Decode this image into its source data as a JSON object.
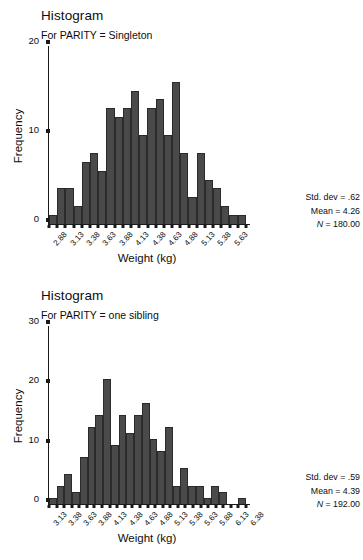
{
  "page": {
    "width": 363,
    "height": 560,
    "background": "#ffffff"
  },
  "style": {
    "bar_fill": "#4a4a4a",
    "bar_stroke": "#2b2b2b",
    "axis_color": "#1a1a1a",
    "text_color": "#0d0d0d"
  },
  "panels": [
    {
      "title": "Histogram",
      "subtitle": "For PARITY = Singleton",
      "xlabel": "Weight (kg)",
      "ylabel": "Frequency",
      "yticks": [
        0,
        10,
        20
      ],
      "stats": {
        "sd_label": "Std. dev = .62",
        "mean_label": "Mean = 4.26",
        "n_symbol": "N",
        "n_label": " = 180.00"
      }
    },
    {
      "title": "Histogram",
      "subtitle": "For PARITY = one sibling",
      "xlabel": "Weight (kg)",
      "ylabel": "Frequency",
      "yticks": [
        0,
        10,
        20,
        30
      ],
      "stats": {
        "sd_label": "Std. dev = .59",
        "mean_label": "Mean = 4.39",
        "n_symbol": "N",
        "n_label": " = 192.00"
      }
    }
  ],
  "chart_data": [
    {
      "type": "bar",
      "title": "Histogram",
      "subtitle": "For PARITY = Singleton",
      "xlabel": "Weight (kg)",
      "ylabel": "Frequency",
      "ylim": [
        0,
        20
      ],
      "yticks": [
        0,
        10,
        20
      ],
      "grid": false,
      "legend": "none",
      "bin_width": 0.25,
      "categories": [
        "2.88",
        "3.13",
        "3.38",
        "3.63",
        "3.88",
        "4.13",
        "4.38",
        "4.63",
        "4.88",
        "5.13",
        "5.38",
        "5.63"
      ],
      "tick_labels_shown": [
        "2.88",
        "3.13",
        "3.38",
        "3.63",
        "3.88",
        "4.13",
        "4.38",
        "4.63",
        "4.88",
        "5.13",
        "5.38",
        "5.63"
      ],
      "bin_centers": [
        2.88,
        3.0,
        3.13,
        3.25,
        3.38,
        3.5,
        3.63,
        3.75,
        3.88,
        4.0,
        4.13,
        4.25,
        4.38,
        4.5,
        4.63,
        4.75,
        4.88,
        5.0,
        5.13,
        5.25,
        5.38,
        5.5,
        5.63,
        5.75
      ],
      "values": [
        1,
        4,
        4,
        2,
        7,
        8,
        6,
        13,
        12,
        13,
        15,
        10,
        13,
        14,
        10,
        16,
        8,
        3,
        8,
        5,
        4,
        2,
        1,
        1
      ],
      "annotations": {
        "std_dev": 0.62,
        "mean": 4.26,
        "n": 180.0
      }
    },
    {
      "type": "bar",
      "title": "Histogram",
      "subtitle": "For PARITY = one sibling",
      "xlabel": "Weight (kg)",
      "ylabel": "Frequency",
      "ylim": [
        0,
        30
      ],
      "yticks": [
        0,
        10,
        20,
        30
      ],
      "grid": false,
      "legend": "none",
      "bin_width": 0.25,
      "categories": [
        "3.13",
        "3.38",
        "3.63",
        "3.88",
        "4.13",
        "4.38",
        "4.63",
        "4.88",
        "5.13",
        "5.38",
        "5.63",
        "5.88",
        "6.13",
        "6.38"
      ],
      "tick_labels_shown": [
        "3.13",
        "3.38",
        "3.63",
        "3.88",
        "4.13",
        "4.38",
        "4.63",
        "4.88",
        "5.13",
        "5.38",
        "5.63",
        "5.88",
        "6.13",
        "6.38"
      ],
      "bin_centers": [
        3.13,
        3.25,
        3.38,
        3.5,
        3.63,
        3.75,
        3.88,
        4.0,
        4.13,
        4.25,
        4.38,
        4.5,
        4.63,
        4.75,
        4.88,
        5.0,
        5.13,
        5.25,
        5.38,
        5.5,
        5.63,
        5.75,
        5.88,
        6.0,
        6.13,
        6.38
      ],
      "values": [
        1,
        3,
        5,
        2,
        8,
        13,
        15,
        21,
        10,
        15,
        12,
        15,
        17,
        11,
        9,
        13,
        3,
        6,
        3,
        3,
        1,
        3,
        2,
        0,
        0,
        1
      ],
      "annotations": {
        "std_dev": 0.59,
        "mean": 4.39,
        "n": 192.0
      }
    }
  ]
}
